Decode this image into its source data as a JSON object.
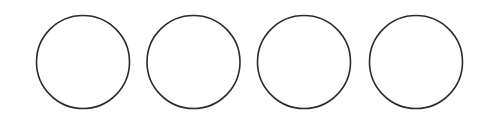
{
  "diagram": {
    "background": "#ffffff",
    "stroke_color": "#2b2b2b",
    "stroke_width": 1.6,
    "fill": "none",
    "circles": [
      {
        "id": "circle-1",
        "cx": 83,
        "cy": 62,
        "r": 46.5
      },
      {
        "id": "circle-2",
        "cx": 193.5,
        "cy": 62,
        "r": 46.5
      },
      {
        "id": "circle-3",
        "cx": 304,
        "cy": 62,
        "r": 46.5
      },
      {
        "id": "circle-4",
        "cx": 416,
        "cy": 62,
        "r": 46.5
      }
    ]
  }
}
